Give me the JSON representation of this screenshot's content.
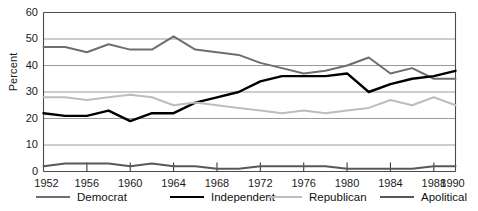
{
  "chart_data": {
    "type": "line",
    "title": "",
    "xlabel": "",
    "ylabel": "Percent",
    "xlim": [
      1952,
      1990
    ],
    "ylim": [
      0,
      60
    ],
    "grid": true,
    "legend_position": "bottom",
    "x_ticks": [
      1952,
      1956,
      1960,
      1964,
      1968,
      1972,
      1976,
      1980,
      1984,
      1988,
      1990
    ],
    "y_ticks": [
      0,
      10,
      20,
      30,
      40,
      50,
      60
    ],
    "x": [
      1952,
      1954,
      1956,
      1958,
      1960,
      1962,
      1964,
      1966,
      1968,
      1970,
      1972,
      1974,
      1976,
      1978,
      1980,
      1982,
      1984,
      1986,
      1988,
      1990
    ],
    "series": [
      {
        "name": "Democrat",
        "color": "#6e6e6e",
        "width": 2.0,
        "values": [
          47,
          47,
          45,
          48,
          46,
          46,
          51,
          46,
          45,
          44,
          41,
          39,
          37,
          38,
          40,
          43,
          37,
          39,
          35,
          35
        ]
      },
      {
        "name": "Independent",
        "color": "#000000",
        "width": 2.4,
        "values": [
          22,
          21,
          21,
          23,
          19,
          22,
          22,
          26,
          28,
          30,
          34,
          36,
          36,
          36,
          37,
          30,
          33,
          35,
          36,
          38
        ]
      },
      {
        "name": "Republican",
        "color": "#bdbdbd",
        "width": 2.0,
        "values": [
          28,
          28,
          27,
          28,
          29,
          28,
          25,
          26,
          25,
          24,
          23,
          22,
          23,
          22,
          23,
          24,
          27,
          25,
          28,
          25
        ]
      },
      {
        "name": "Apolitical",
        "color": "#585858",
        "width": 2.0,
        "values": [
          2,
          3,
          3,
          3,
          2,
          3,
          2,
          2,
          1,
          1,
          2,
          2,
          2,
          2,
          1,
          1,
          1,
          1,
          2,
          2
        ]
      }
    ]
  },
  "axes": {
    "y_title": "Percent",
    "y_tick_labels": [
      "60",
      "50",
      "40",
      "30",
      "20",
      "10",
      "0"
    ],
    "x_tick_labels": [
      "1952",
      "1956",
      "1960",
      "1964",
      "1968",
      "1972",
      "1976",
      "1980",
      "1984",
      "1988",
      "1990"
    ]
  },
  "legend": {
    "items": [
      {
        "label": "Democrat",
        "color": "#6e6e6e",
        "width": "2px"
      },
      {
        "label": "Independent",
        "color": "#000000",
        "width": "2.6px"
      },
      {
        "label": "Republican",
        "color": "#bdbdbd",
        "width": "2px"
      },
      {
        "label": "Apolitical",
        "color": "#585858",
        "width": "2px"
      }
    ]
  }
}
